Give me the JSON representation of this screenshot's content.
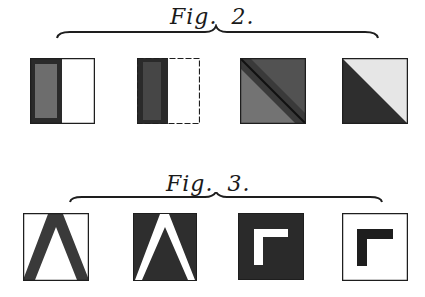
{
  "figures": [
    {
      "label": "Fig.",
      "number": "2.",
      "panels": [
        {
          "id": "fig2-a",
          "description": "square split vertically, left dark half, right white half"
        },
        {
          "id": "fig2-b",
          "description": "square split vertically, left darker half, right white half"
        },
        {
          "id": "fig2-c",
          "description": "square fully dark, divided diagonally from top-left to bottom-right"
        },
        {
          "id": "fig2-d",
          "description": "square divided diagonally, lower-left dark triangle, upper-right light triangle"
        }
      ]
    },
    {
      "label": "Fig.",
      "number": "3.",
      "panels": [
        {
          "id": "fig3-a",
          "description": "white square with dark inverted-V chevron"
        },
        {
          "id": "fig3-b",
          "description": "dark square with white inverted-V chevron"
        },
        {
          "id": "fig3-c",
          "description": "dark square with white L-shaped corner"
        },
        {
          "id": "fig3-d",
          "description": "white square with dark L-shaped corner"
        }
      ]
    }
  ],
  "colors": {
    "ink": "#1e1e1e",
    "paper": "#ffffff",
    "mid": "#5a5a5a"
  }
}
